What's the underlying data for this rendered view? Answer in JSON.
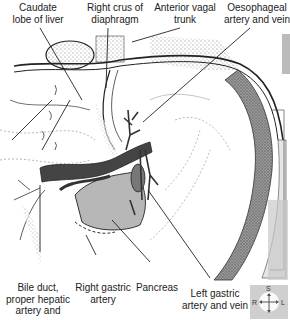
{
  "figure": {
    "labels": {
      "caudate_lobe": [
        "Caudate",
        "lobe of liver"
      ],
      "right_crus": [
        "Right crus of",
        "diaphragm"
      ],
      "anterior_vagal": [
        "Anterior vagal",
        "trunk"
      ],
      "oesophageal": [
        "Oesophageal",
        "artery and vein"
      ],
      "bile_duct": [
        "Bile duct,",
        "proper hepatic",
        "artery and"
      ],
      "right_gastric": [
        "Right gastric",
        "artery"
      ],
      "pancreas": [
        "Pancreas"
      ],
      "left_gastric": [
        "Left gastric",
        "artery and vein"
      ]
    },
    "orientation": {
      "superior": "S",
      "right": "R",
      "left": "L",
      "colors": {
        "background": "#cfcfcf",
        "disc": "#fafafa"
      }
    },
    "colors": {
      "line": "#222222",
      "dark_vessel": "#3a3a3a",
      "mid_tissue": "#8a8a8a",
      "light_tissue": "#bdbdbd",
      "stipple": "#9a9a9a"
    }
  }
}
